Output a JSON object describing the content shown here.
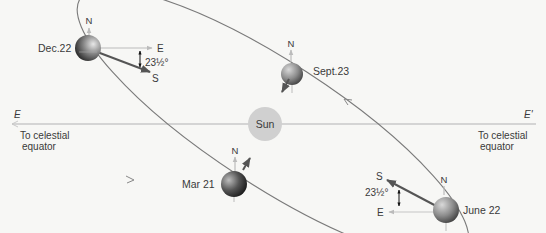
{
  "diagram": {
    "type": "earth-orbit-seasons",
    "sun": {
      "label": "Sun",
      "color": "#cfcfcf"
    },
    "equator_line": {
      "left_label": "E",
      "right_label": "E'",
      "left_caption_line1": "To celestial",
      "left_caption_line2": "equator",
      "right_caption_line1": "To celestial",
      "right_caption_line2": "equator"
    },
    "positions": [
      {
        "id": "dec22",
        "label": "Dec.22",
        "north": "N",
        "east": "E",
        "south": "S",
        "tilt": "23½°"
      },
      {
        "id": "sept23",
        "label": "Sept.23",
        "north": "N"
      },
      {
        "id": "mar21",
        "label": "Mar 21",
        "north": "N"
      },
      {
        "id": "june22",
        "label": "June 22",
        "north": "N",
        "east": "E",
        "south": "S",
        "tilt": "23½°"
      }
    ],
    "colors": {
      "orbit": "#7a7a7a",
      "axis_light": "#c8c8c8",
      "tilt_arrow": "#555555",
      "text": "#3a3a3a",
      "background": "#f7f7f5"
    }
  }
}
